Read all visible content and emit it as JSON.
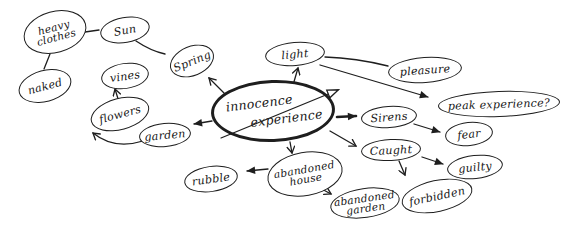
{
  "canvas": {
    "width": 578,
    "height": 232,
    "background": "#ffffff",
    "ink": "#1e1e1e"
  },
  "diagram_type": "hand-drawn mind map",
  "nodes": [
    {
      "id": "heavy-clothes",
      "lines": [
        "heavy",
        "clothes"
      ],
      "cx": 55,
      "cy": 32,
      "rx": 32,
      "ry": 21,
      "rot": -15
    },
    {
      "id": "sun",
      "lines": [
        "Sun"
      ],
      "cx": 125,
      "cy": 30,
      "rx": 25,
      "ry": 13,
      "rot": -10
    },
    {
      "id": "naked",
      "lines": [
        "naked"
      ],
      "cx": 45,
      "cy": 86,
      "rx": 27,
      "ry": 16,
      "rot": -15
    },
    {
      "id": "vines",
      "lines": [
        "vines"
      ],
      "cx": 125,
      "cy": 76,
      "rx": 24,
      "ry": 13,
      "rot": -8
    },
    {
      "id": "spring",
      "lines": [
        "Spring"
      ],
      "cx": 192,
      "cy": 61,
      "rx": 23,
      "ry": 15,
      "rot": -22
    },
    {
      "id": "flowers",
      "lines": [
        "flowers"
      ],
      "cx": 120,
      "cy": 114,
      "rx": 30,
      "ry": 16,
      "rot": -15
    },
    {
      "id": "garden",
      "lines": [
        "garden"
      ],
      "cx": 165,
      "cy": 135,
      "rx": 26,
      "ry": 12,
      "rot": -5
    },
    {
      "id": "innocence-experience",
      "lines": [
        "innocence",
        "experience"
      ],
      "cx": 273,
      "cy": 111,
      "rx": 62,
      "ry": 31,
      "rot": -2,
      "emphasis": true
    },
    {
      "id": "light",
      "lines": [
        "light"
      ],
      "cx": 295,
      "cy": 54,
      "rx": 30,
      "ry": 12,
      "rot": -5
    },
    {
      "id": "pleasure",
      "lines": [
        "pleasure"
      ],
      "cx": 425,
      "cy": 70,
      "rx": 37,
      "ry": 13,
      "rot": -4
    },
    {
      "id": "peak-experience",
      "lines": [
        "peak experience?"
      ],
      "cx": 499,
      "cy": 104,
      "rx": 61,
      "ry": 13,
      "rot": -2
    },
    {
      "id": "sirens",
      "lines": [
        "Sirens"
      ],
      "cx": 389,
      "cy": 117,
      "rx": 28,
      "ry": 11,
      "rot": -4
    },
    {
      "id": "fear",
      "lines": [
        "fear"
      ],
      "cx": 469,
      "cy": 134,
      "rx": 24,
      "ry": 12,
      "rot": -6
    },
    {
      "id": "caught",
      "lines": [
        "Caught"
      ],
      "cx": 391,
      "cy": 150,
      "rx": 30,
      "ry": 11,
      "rot": -3
    },
    {
      "id": "guilty",
      "lines": [
        "guilty"
      ],
      "cx": 475,
      "cy": 167,
      "rx": 28,
      "ry": 12,
      "rot": -6
    },
    {
      "id": "forbidden",
      "lines": [
        "forbidden"
      ],
      "cx": 437,
      "cy": 196,
      "rx": 36,
      "ry": 16,
      "rot": -12
    },
    {
      "id": "abandoned-house",
      "lines": [
        "abandoned",
        "house"
      ],
      "cx": 305,
      "cy": 174,
      "rx": 38,
      "ry": 22,
      "rot": -10
    },
    {
      "id": "abandoned-garden",
      "lines": [
        "abandoned",
        "garden"
      ],
      "cx": 365,
      "cy": 203,
      "rx": 35,
      "ry": 15,
      "rot": -8
    },
    {
      "id": "rubble",
      "lines": [
        "rubble"
      ],
      "cx": 211,
      "cy": 179,
      "rx": 27,
      "ry": 13,
      "rot": -8
    }
  ],
  "edges": [
    {
      "id": "heavy-clothes-to-sun",
      "d": "M85,32 L99,30",
      "arrow": "none"
    },
    {
      "id": "heavy-clothes-to-naked",
      "d": "M50,54 L44,69",
      "arrow": "none"
    },
    {
      "id": "sun-to-spring",
      "d": "M136,41 Q151,51 165,54",
      "arrow": "none"
    },
    {
      "id": "center-to-spring",
      "d": "M224,93 L209,78",
      "arrow": "v"
    },
    {
      "id": "center-to-light",
      "d": "M291,92 L298,68",
      "arrow": "v"
    },
    {
      "id": "light-to-pleasure",
      "d": "M325,57 Q356,58 388,66",
      "arrow": "none"
    },
    {
      "id": "light-to-peak-experience",
      "d": "M320,65 L428,97",
      "arrow": "solid"
    },
    {
      "id": "center-diagonal-arrow",
      "d": "M221,138 L338,90",
      "arrow": "open",
      "w": 1.2,
      "layer": "over"
    },
    {
      "id": "center-to-garden",
      "d": "M212,121 L194,124",
      "arrow": "solid"
    },
    {
      "id": "garden-to-flowers",
      "d": "M143,141 Q114,150 93,133",
      "arrow": "v"
    },
    {
      "id": "flowers-to-vines",
      "d": "M119,102 L115,89",
      "arrow": "v"
    },
    {
      "id": "center-to-sirens",
      "d": "M337,117 L356,116",
      "arrow": "solid",
      "w": 2.6
    },
    {
      "id": "sirens-to-fear",
      "d": "M414,124 L440,132",
      "arrow": "solid"
    },
    {
      "id": "center-to-caught",
      "d": "M330,131 L356,146",
      "arrow": "v"
    },
    {
      "id": "caught-to-guilty",
      "d": "M422,157 L443,164",
      "arrow": "solid"
    },
    {
      "id": "caught-to-forbidden",
      "d": "M399,161 L405,175",
      "arrow": "v"
    },
    {
      "id": "center-to-abandoned-house",
      "d": "M290,142 L292,153",
      "arrow": "v"
    },
    {
      "id": "abandoned-house-to-rubble",
      "d": "M268,169 L247,171",
      "arrow": "solid"
    },
    {
      "id": "abandoned-house-to-abandoned-garden",
      "d": "M318,187 L331,194",
      "arrow": "v"
    }
  ]
}
